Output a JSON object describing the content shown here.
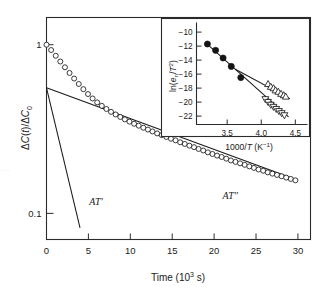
{
  "figure": {
    "background_color": "#ffffff",
    "ink_color": "#1a1a1a",
    "edge_fragment_text": "· · · ·"
  },
  "chart_data": [
    {
      "id": "main",
      "type": "scatter",
      "title": "",
      "xlabel": "Time (10³ s)",
      "ylabel": "ΔC(t)/ΔC₀",
      "xlim": [
        0,
        31.5
      ],
      "ylim_log": [
        0.07,
        1.45
      ],
      "yscale": "log",
      "grid": false,
      "legend": "none",
      "xticks": [
        0,
        5,
        10,
        15,
        20,
        25,
        30
      ],
      "xtick_labels": [
        "0",
        "5",
        "10",
        "15",
        "20",
        "25",
        "30"
      ],
      "yticks": [
        1,
        0.1
      ],
      "ytick_labels": [
        "1",
        "0.1"
      ],
      "series": [
        {
          "name": "ΔC(t)/ΔC₀ decay",
          "marker": "open-circle",
          "x": [
            0.0,
            0.55,
            1.1,
            1.65,
            2.2,
            2.75,
            3.3,
            3.85,
            4.4,
            4.95,
            5.5,
            6.05,
            6.6,
            7.15,
            7.7,
            8.25,
            8.8,
            9.35,
            9.9,
            10.45,
            11.0,
            11.55,
            12.1,
            12.65,
            13.2,
            13.75,
            14.3,
            14.85,
            15.4,
            15.95,
            16.5,
            17.05,
            17.6,
            18.15,
            18.7,
            19.25,
            19.8,
            20.35,
            20.9,
            21.45,
            22.0,
            22.55,
            23.1,
            23.65,
            24.2,
            24.75,
            25.3,
            25.85,
            26.4,
            26.95,
            27.5,
            28.05,
            28.6,
            29.15,
            29.7
          ],
          "y": [
            1.0,
            0.93,
            0.86,
            0.795,
            0.735,
            0.68,
            0.63,
            0.585,
            0.545,
            0.51,
            0.48,
            0.455,
            0.434,
            0.416,
            0.4,
            0.386,
            0.373,
            0.361,
            0.35,
            0.34,
            0.331,
            0.322,
            0.314,
            0.306,
            0.298,
            0.291,
            0.284,
            0.277,
            0.271,
            0.264,
            0.258,
            0.252,
            0.247,
            0.241,
            0.236,
            0.23,
            0.225,
            0.22,
            0.216,
            0.211,
            0.206,
            0.202,
            0.198,
            0.194,
            0.19,
            0.186,
            0.182,
            0.179,
            0.175,
            0.172,
            0.169,
            0.166,
            0.163,
            0.16,
            0.157
          ]
        }
      ],
      "fit_lines": [
        {
          "name": "AT' steep component",
          "label": "AT'",
          "x": [
            0.0,
            4.0
          ],
          "y": [
            0.555,
            0.082
          ],
          "label_position": {
            "x": 5.1,
            "y": 0.112
          }
        },
        {
          "name": "AT″ slow component",
          "label": "AT″",
          "x": [
            0.0,
            30.0
          ],
          "y": [
            0.555,
            0.157
          ],
          "label_position": {
            "x": 21.0,
            "y": 0.122
          }
        }
      ]
    },
    {
      "id": "inset",
      "type": "scatter",
      "title": "",
      "xlabel": "1000/T (K⁻¹)",
      "ylabel": "ln(eₙ/T²)",
      "xlim": [
        3.05,
        4.62
      ],
      "ylim": [
        -23.2,
        -9.2
      ],
      "yscale": "linear",
      "grid": false,
      "legend": "none",
      "xticks": [
        3.5,
        4.0,
        4.5
      ],
      "xtick_labels": [
        "3.5",
        "4.0",
        "4.5"
      ],
      "yticks": [
        -10,
        -12,
        -14,
        -16,
        -18,
        -20,
        -22
      ],
      "ytick_labels": [
        "-10",
        "-12",
        "-14",
        "-16",
        "-18",
        "-20",
        "-22"
      ],
      "series": [
        {
          "name": "filled circles (high T)",
          "marker": "filled-circle",
          "x": [
            3.21,
            3.33,
            3.44,
            3.56,
            3.7
          ],
          "y": [
            -11.7,
            -12.6,
            -13.7,
            -14.9,
            -16.5
          ]
        },
        {
          "name": "open up-triangles (AT″ branch)",
          "marker": "open-triangle-up",
          "x": [
            4.1,
            4.14,
            4.18,
            4.21,
            4.25,
            4.29,
            4.33,
            4.36
          ],
          "y": [
            -17.4,
            -17.8,
            -18.0,
            -18.3,
            -18.5,
            -18.8,
            -19.0,
            -19.2
          ]
        },
        {
          "name": "open down-triangles (AT' branch)",
          "marker": "open-triangle-down",
          "x": [
            4.06,
            4.1,
            4.14,
            4.18,
            4.22,
            4.26,
            4.3,
            4.34
          ],
          "y": [
            -19.6,
            -20.0,
            -20.4,
            -20.7,
            -21.0,
            -21.3,
            -21.6,
            -21.9
          ]
        }
      ],
      "fit_lines": [
        {
          "name": "Arrhenius fit upper",
          "x": [
            3.62,
            4.42
          ],
          "y": [
            -15.3,
            -19.5
          ]
        },
        {
          "name": "Arrhenius fit lower",
          "x": [
            3.24,
            4.4
          ],
          "y": [
            -12.0,
            -22.1
          ]
        }
      ]
    }
  ]
}
